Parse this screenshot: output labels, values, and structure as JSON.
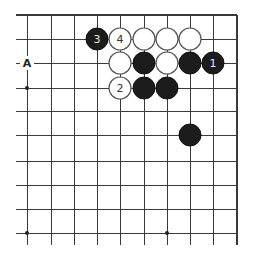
{
  "diagram": {
    "type": "go-board-fragment",
    "grid": {
      "columns_x": [
        27,
        51,
        74,
        97,
        120,
        144,
        167,
        190,
        213,
        237
      ],
      "rows_y": [
        15,
        39,
        63,
        88,
        111,
        135,
        161,
        185,
        209,
        233
      ],
      "left_open_extent_x": 16,
      "bottom_open_extent_y": 245,
      "top_edge": true,
      "right_edge": true
    },
    "hoshi": [
      {
        "col": 0,
        "row": 3
      },
      {
        "col": 0,
        "row": 9
      },
      {
        "col": 6,
        "row": 9
      }
    ],
    "stones": [
      {
        "color": "black",
        "col": 3,
        "row": 1,
        "label": "3"
      },
      {
        "color": "white",
        "col": 4,
        "row": 1,
        "label": "4"
      },
      {
        "color": "white",
        "col": 5,
        "row": 1,
        "label": ""
      },
      {
        "color": "white",
        "col": 6,
        "row": 1,
        "label": ""
      },
      {
        "color": "white",
        "col": 7,
        "row": 1,
        "label": ""
      },
      {
        "color": "white",
        "col": 4,
        "row": 2,
        "label": ""
      },
      {
        "color": "black",
        "col": 5,
        "row": 2,
        "label": ""
      },
      {
        "color": "white",
        "col": 6,
        "row": 2,
        "label": ""
      },
      {
        "color": "black",
        "col": 7,
        "row": 2,
        "label": ""
      },
      {
        "color": "black",
        "col": 8,
        "row": 2,
        "label": "1"
      },
      {
        "color": "white",
        "col": 4,
        "row": 3,
        "label": "2"
      },
      {
        "color": "black",
        "col": 5,
        "row": 3,
        "label": ""
      },
      {
        "color": "black",
        "col": 6,
        "row": 3,
        "label": ""
      },
      {
        "color": "black",
        "col": 7,
        "row": 5,
        "label": ""
      }
    ],
    "marks": [
      {
        "text": "A",
        "col": 0,
        "row": 2
      }
    ],
    "stone_radius": 11,
    "colors": {
      "black_stone": "#1c1c1c",
      "white_stone": "#ffffff",
      "grid": "#3a3a3a"
    }
  }
}
